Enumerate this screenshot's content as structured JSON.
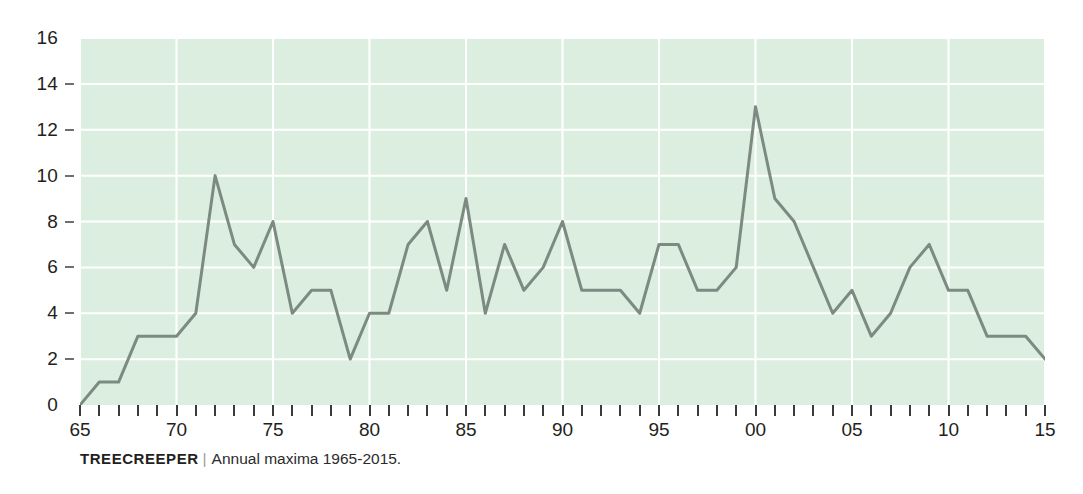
{
  "caption": {
    "name": "TREECREEPER",
    "separator": "|",
    "text": "Annual maxima 1965-2015."
  },
  "colors": {
    "plot_background": "#dceee0",
    "gridline": "#ffffff",
    "line": "#7d8a82",
    "text": "#231f20",
    "tick": "#3b3b3b"
  },
  "chart_data": {
    "type": "line",
    "title": "TREECREEPER",
    "subtitle": "Annual maxima 1965-2015.",
    "xlabel": "",
    "ylabel": "",
    "xlim": [
      1965,
      2015
    ],
    "ylim": [
      0,
      16
    ],
    "grid": true,
    "legend": null,
    "y_ticks": [
      0,
      2,
      4,
      6,
      8,
      10,
      12,
      14,
      16
    ],
    "y_tick_labels": [
      "0",
      "2",
      "4",
      "6",
      "8",
      "10",
      "12",
      "14",
      "16"
    ],
    "x_tick_values": [
      1965,
      1970,
      1975,
      1980,
      1985,
      1990,
      1995,
      2000,
      2005,
      2010,
      2015
    ],
    "x_tick_labels": [
      "65",
      "70",
      "75",
      "80",
      "85",
      "90",
      "95",
      "00",
      "05",
      "10",
      "15"
    ],
    "x_minor_tick_step": 1,
    "x": [
      1965,
      1966,
      1967,
      1968,
      1969,
      1970,
      1971,
      1972,
      1973,
      1974,
      1975,
      1976,
      1977,
      1978,
      1979,
      1980,
      1981,
      1982,
      1983,
      1984,
      1985,
      1986,
      1987,
      1988,
      1989,
      1990,
      1991,
      1992,
      1993,
      1994,
      1995,
      1996,
      1997,
      1998,
      1999,
      2000,
      2001,
      2002,
      2003,
      2004,
      2005,
      2006,
      2007,
      2008,
      2009,
      2010,
      2011,
      2012,
      2013,
      2014,
      2015
    ],
    "values": [
      0,
      1,
      1,
      3,
      3,
      3,
      4,
      10,
      7,
      6,
      8,
      4,
      5,
      5,
      2,
      4,
      4,
      7,
      8,
      5,
      9,
      4,
      7,
      5,
      6,
      8,
      5,
      5,
      5,
      4,
      7,
      7,
      5,
      5,
      6,
      13,
      9,
      8,
      6,
      4,
      5,
      3,
      4,
      6,
      7,
      5,
      5,
      3,
      3,
      3,
      2
    ],
    "series": [
      {
        "name": "Annual maxima",
        "values": [
          0,
          1,
          1,
          3,
          3,
          3,
          4,
          10,
          7,
          6,
          8,
          4,
          5,
          5,
          2,
          4,
          4,
          7,
          8,
          5,
          9,
          4,
          7,
          5,
          6,
          8,
          5,
          5,
          5,
          4,
          7,
          7,
          5,
          5,
          6,
          13,
          9,
          8,
          6,
          4,
          5,
          3,
          4,
          6,
          7,
          5,
          5,
          3,
          3,
          3,
          2
        ]
      }
    ]
  }
}
